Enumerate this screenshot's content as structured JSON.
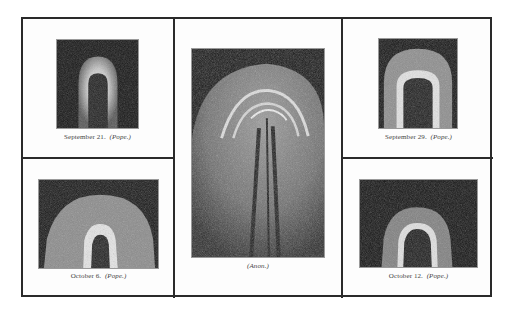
{
  "figure": {
    "panels": [
      {
        "id": "top-left",
        "date": "September 21.",
        "source": "(Pope.)"
      },
      {
        "id": "center",
        "date": "",
        "source": "(Anon.)"
      },
      {
        "id": "top-right",
        "date": "September 29.",
        "source": "(Pope.)"
      },
      {
        "id": "bottom-left",
        "date": "October 6.",
        "source": "(Pope.)"
      },
      {
        "id": "bottom-right",
        "date": "October 12.",
        "source": "(Pope.)"
      }
    ],
    "colors": {
      "frame": "#2a2a2a",
      "plate_bg": "#141414",
      "glow": "#e8e8e8"
    }
  }
}
